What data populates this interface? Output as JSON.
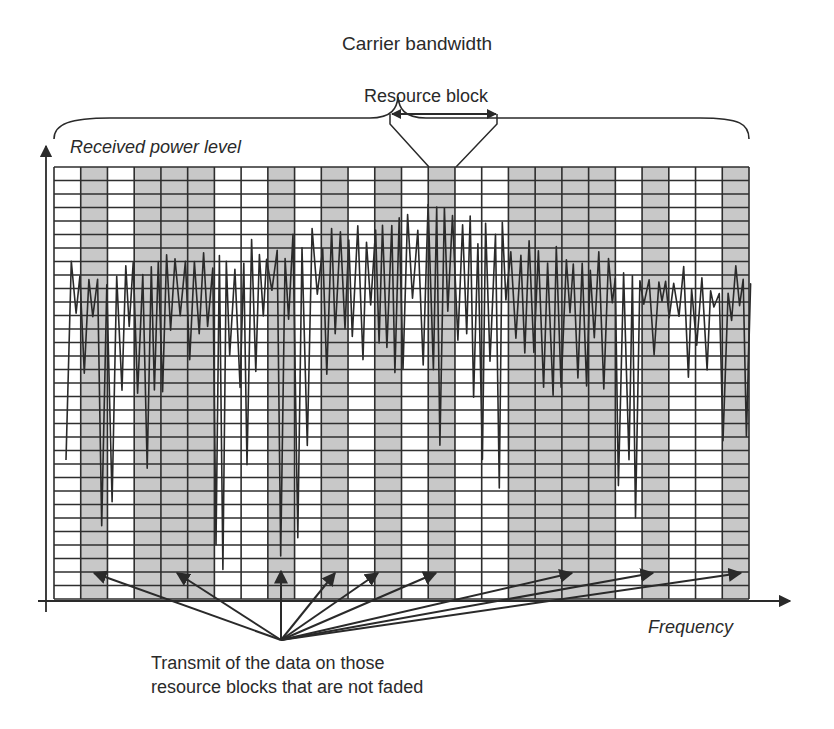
{
  "diagram": {
    "title": "Carrier bandwidth",
    "resource_block_label": "Resource block",
    "y_axis_label": "Received power level",
    "x_axis_label": "Frequency",
    "caption_line1": "Transmit of the data on those",
    "caption_line2": "resource blocks that are not faded",
    "colors": {
      "grid_line": "#2e2e2e",
      "faded_block": "#ffffff",
      "good_block": "#c8c8c8",
      "signal": "#2a2a2a",
      "text": "#2a2a2a"
    },
    "grid": {
      "left": 54,
      "top": 167,
      "right": 749,
      "bottom": 599,
      "columns": 26,
      "rows": 32,
      "column_shading": [
        "white",
        "gray",
        "white",
        "gray",
        "gray",
        "gray",
        "white",
        "white",
        "gray",
        "white",
        "gray",
        "white",
        "gray",
        "white",
        "gray",
        "white",
        "white",
        "gray",
        "gray",
        "gray",
        "gray",
        "white",
        "gray",
        "white",
        "white",
        "gray"
      ]
    },
    "highlighted_resource_block_column": 14,
    "transmit_arrow_origin": [
      281,
      640
    ],
    "transmit_arrow_targets": [
      [
        94,
        573
      ],
      [
        177,
        573
      ],
      [
        281,
        571
      ],
      [
        335,
        573
      ],
      [
        378,
        573
      ],
      [
        436,
        573
      ],
      [
        572,
        573
      ],
      [
        653,
        573
      ],
      [
        741,
        573
      ]
    ]
  }
}
